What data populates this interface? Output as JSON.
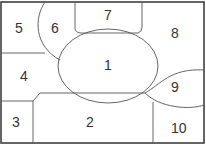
{
  "diagram": {
    "type": "region-map",
    "regions": [
      {
        "id": 1,
        "label": "1"
      },
      {
        "id": 2,
        "label": "2"
      },
      {
        "id": 3,
        "label": "3"
      },
      {
        "id": 4,
        "label": "4"
      },
      {
        "id": 5,
        "label": "5"
      },
      {
        "id": 6,
        "label": "6"
      },
      {
        "id": 7,
        "label": "7"
      },
      {
        "id": 8,
        "label": "8"
      },
      {
        "id": 9,
        "label": "9"
      },
      {
        "id": 10,
        "label": "10"
      }
    ],
    "colors": {
      "stroke": "#555555",
      "border": "#333333",
      "background": "#ffffff"
    }
  }
}
